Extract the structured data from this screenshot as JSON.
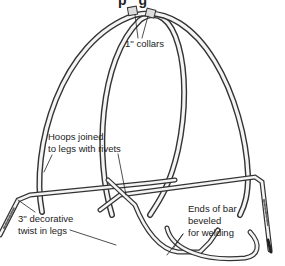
{
  "title_fragment": "p  g",
  "labels": {
    "collars": "1'' collars",
    "hoops_joined_line1": "Hoops joined",
    "hoops_joined_line2": "to legs with rivets",
    "twist_line1": "3'' decorative",
    "twist_line2": "twist in legs",
    "ends_line1": "Ends of bar",
    "ends_line2": "beveled",
    "ends_line3": "for welding"
  },
  "colors": {
    "ink": "#222222",
    "metal_light": "#f2f2f2",
    "metal_mid": "#9a9a9a",
    "background": "#ffffff"
  }
}
